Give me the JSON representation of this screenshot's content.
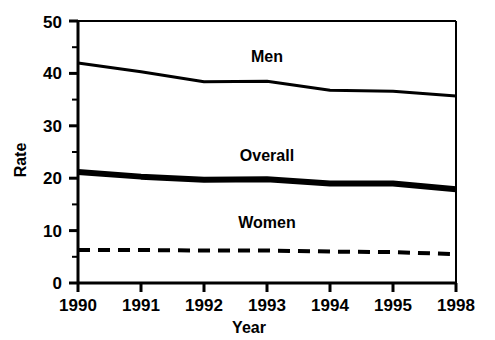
{
  "chart_data": {
    "type": "line",
    "title": "",
    "xlabel": "Year",
    "ylabel": "Rate",
    "x": [
      "1990",
      "1991",
      "1992",
      "1993",
      "1994",
      "1995",
      "1998"
    ],
    "categories": [
      "1990",
      "1991",
      "1992",
      "1993",
      "1994",
      "1995",
      "1998"
    ],
    "xlim": [
      0,
      6
    ],
    "ylim": [
      0,
      50
    ],
    "yticks": [
      "0",
      "10",
      "20",
      "30",
      "40",
      "50"
    ],
    "ytick_values": [
      0,
      10,
      20,
      30,
      40,
      50
    ],
    "yminor_values": [
      5,
      15,
      25,
      35,
      45
    ],
    "grid": "off",
    "legend": "inline-labels",
    "series": [
      {
        "name": "Men",
        "style": "solid-thin",
        "linewidth": 3,
        "color": "#000000",
        "values": [
          42.0,
          40.3,
          38.4,
          38.5,
          36.8,
          36.6,
          35.7
        ]
      },
      {
        "name": "Overall",
        "style": "solid-thick",
        "linewidth": 6,
        "color": "#000000",
        "values": [
          21.2,
          20.3,
          19.7,
          19.8,
          19.0,
          19.0,
          17.9
        ]
      },
      {
        "name": "Women",
        "style": "dashed",
        "linewidth": 4,
        "color": "#000000",
        "values": [
          6.3,
          6.3,
          6.2,
          6.2,
          6.0,
          5.9,
          5.5
        ]
      }
    ],
    "annotations": [
      {
        "text": "Men",
        "x_value": 3.0,
        "y_value": 44.5
      },
      {
        "text": "Overall",
        "x_value": 3.0,
        "y_value": 24.8
      },
      {
        "text": "Women",
        "x_value": 3.0,
        "y_value": 10.0
      }
    ]
  }
}
